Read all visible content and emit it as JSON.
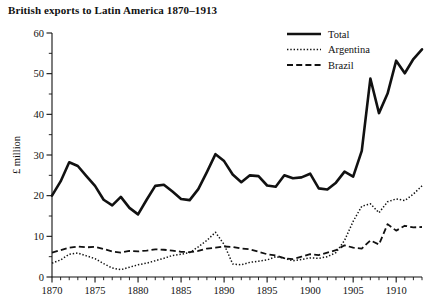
{
  "chart_data": {
    "type": "line",
    "title": "British exports to Latin America 1870–1913",
    "xlabel": "",
    "ylabel": "£ million",
    "xlim": [
      1870,
      1913
    ],
    "ylim": [
      0,
      60
    ],
    "grid": false,
    "legend_position": "top-right",
    "y_ticks_major": [
      0,
      10,
      20,
      30,
      40,
      50,
      60
    ],
    "y_tick_labels": [
      "0",
      "10",
      "20",
      "30",
      "40",
      "50",
      "60"
    ],
    "y_tick_minor_step": 5,
    "x_ticks_major": [
      1870,
      1875,
      1880,
      1885,
      1890,
      1895,
      1900,
      1905,
      1910
    ],
    "x_tick_labels": [
      "1870",
      "1875",
      "1880",
      "1885",
      "1890",
      "1895",
      "1900",
      "1905",
      "1910"
    ],
    "x_tick_minor_step": 1,
    "x": [
      1870,
      1871,
      1872,
      1873,
      1874,
      1875,
      1876,
      1877,
      1878,
      1879,
      1880,
      1881,
      1882,
      1883,
      1884,
      1885,
      1886,
      1887,
      1888,
      1889,
      1890,
      1891,
      1892,
      1893,
      1894,
      1895,
      1896,
      1897,
      1898,
      1899,
      1900,
      1901,
      1902,
      1903,
      1904,
      1905,
      1906,
      1907,
      1908,
      1909,
      1910,
      1911,
      1912,
      1913
    ],
    "series": [
      {
        "name": "Total",
        "style": "solid",
        "values": [
          20.0,
          23.5,
          28.2,
          27.3,
          24.8,
          22.4,
          19.0,
          17.6,
          19.7,
          17.0,
          15.4,
          19.0,
          22.4,
          22.7,
          21.0,
          19.2,
          18.9,
          21.6,
          25.8,
          30.2,
          28.5,
          25.2,
          23.3,
          25.0,
          24.8,
          22.5,
          22.2,
          25.0,
          24.3,
          24.5,
          25.4,
          21.8,
          21.5,
          23.2,
          25.9,
          24.7,
          31.0,
          48.8,
          40.3,
          45.1,
          53.2,
          50.1,
          53.6,
          56.0
        ]
      },
      {
        "name": "Argentina",
        "style": "dotted",
        "values": [
          3.4,
          4.2,
          5.6,
          5.9,
          5.2,
          4.5,
          3.3,
          2.2,
          1.8,
          2.4,
          3.0,
          3.4,
          4.0,
          4.6,
          5.3,
          5.6,
          6.0,
          7.4,
          9.0,
          11.0,
          8.0,
          3.2,
          3.0,
          3.6,
          3.9,
          4.2,
          5.0,
          4.6,
          4.0,
          4.3,
          4.7,
          4.6,
          5.0,
          6.0,
          9.0,
          13.7,
          17.4,
          18.0,
          15.8,
          18.5,
          19.2,
          18.8,
          20.4,
          22.4
        ]
      },
      {
        "name": "Brazil",
        "style": "dashed",
        "values": [
          6.0,
          6.6,
          7.2,
          7.5,
          7.3,
          7.4,
          6.9,
          6.3,
          6.0,
          6.4,
          6.3,
          6.5,
          6.8,
          6.7,
          6.5,
          6.2,
          6.1,
          6.4,
          7.0,
          7.2,
          7.5,
          7.4,
          7.0,
          6.8,
          6.2,
          5.6,
          5.3,
          4.6,
          4.4,
          5.0,
          5.6,
          5.4,
          6.0,
          6.6,
          7.8,
          7.2,
          7.0,
          9.0,
          8.0,
          13.0,
          11.4,
          12.6,
          12.2,
          12.3
        ]
      }
    ]
  }
}
